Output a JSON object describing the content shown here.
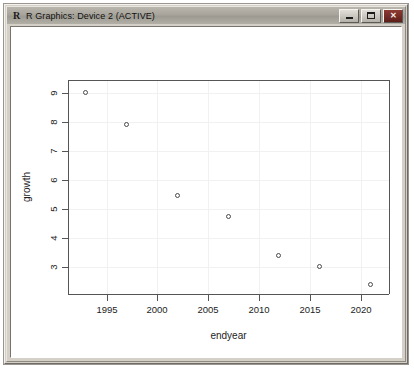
{
  "window": {
    "title": "R Graphics: Device 2 (ACTIVE)",
    "icon": "R",
    "controls": {
      "minimize": "minimize-button",
      "maximize": "maximize-button",
      "close": "close-button",
      "close_glyph": "✕"
    },
    "frame_color": "#d4d0c8",
    "canvas_color": "#ffffff",
    "close_color": "#7a2f28"
  },
  "chart_data": {
    "type": "scatter",
    "title": "",
    "xlabel": "endyear",
    "ylabel": "growth",
    "xlim": [
      1991.2,
      2022.8
    ],
    "ylim": [
      2.05,
      9.45
    ],
    "xticks": [
      1995,
      2000,
      2005,
      2010,
      2015,
      2020
    ],
    "yticks": [
      3,
      4,
      5,
      6,
      7,
      8,
      9
    ],
    "xtick_labels": [
      "1995",
      "2000",
      "2005",
      "2010",
      "2015",
      "2020"
    ],
    "ytick_labels": [
      "3",
      "4",
      "5",
      "6",
      "7",
      "8",
      "9"
    ],
    "grid": true,
    "grid_color": "#f1f1f1",
    "legend": "none",
    "point_symbol": "open-circle",
    "point_color": "#4a4a4a",
    "x": [
      1993,
      1997,
      2002,
      2007,
      2012,
      2016,
      2021
    ],
    "y": [
      9.0,
      7.9,
      5.45,
      4.7,
      3.35,
      3.0,
      2.35
    ],
    "series": [
      {
        "name": "growth",
        "points": [
          {
            "x": 1993,
            "y": 9.0
          },
          {
            "x": 1997,
            "y": 7.9
          },
          {
            "x": 2002,
            "y": 5.45
          },
          {
            "x": 2007,
            "y": 4.7
          },
          {
            "x": 2012,
            "y": 3.35
          },
          {
            "x": 2016,
            "y": 3.0
          },
          {
            "x": 2021,
            "y": 2.35
          }
        ]
      }
    ]
  }
}
